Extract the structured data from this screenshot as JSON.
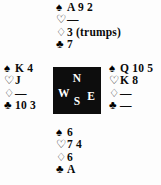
{
  "diagram": {
    "suits": {
      "spade_symbol": "♠",
      "heart_symbol": "♡",
      "diamond_symbol": "♢",
      "club_symbol": "♣"
    },
    "compass": {
      "north_label": "N",
      "west_label": "W",
      "east_label": "E",
      "south_label": "S",
      "box_color": "#0d0d0d",
      "letter_color": "#ffffff"
    },
    "hands": {
      "north": {
        "position_label": "North",
        "spades": "A 9 2",
        "hearts": "—",
        "diamonds": "3 (trumps)",
        "clubs": "7"
      },
      "west": {
        "position_label": "West",
        "spades": "K 4",
        "hearts": "J",
        "diamonds": "—",
        "clubs": "10 3"
      },
      "east": {
        "position_label": "East",
        "spades": "Q 10 5",
        "hearts": "K 8",
        "diamonds": "—",
        "clubs": "—"
      },
      "south": {
        "position_label": "South",
        "spades": "6",
        "hearts": "7 4",
        "diamonds": "6",
        "clubs": "A"
      }
    }
  }
}
